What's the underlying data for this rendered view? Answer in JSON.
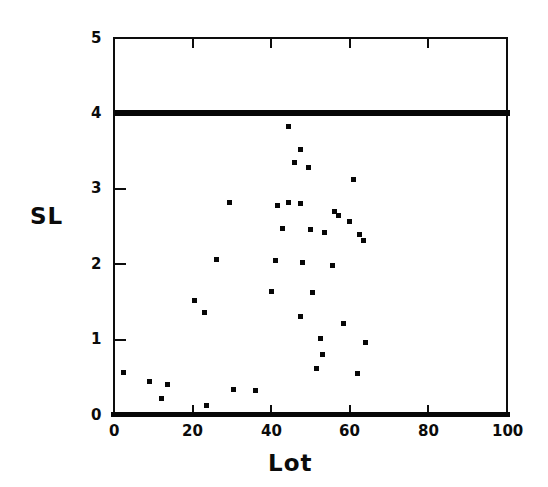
{
  "chart_data": {
    "type": "scatter",
    "title": "",
    "xlabel": "Lot",
    "ylabel": "SL",
    "xlim": [
      0,
      100
    ],
    "ylim": [
      0,
      5
    ],
    "xticks": [
      0,
      20,
      40,
      60,
      80,
      100
    ],
    "yticks": [
      0,
      1,
      2,
      3,
      4,
      5
    ],
    "xtick_labels": [
      "0",
      "20",
      "40",
      "60",
      "80",
      "100"
    ],
    "ytick_labels": [
      "0",
      "1",
      "2",
      "3",
      "4",
      "5"
    ],
    "grid": false,
    "legend": null,
    "marker": "square",
    "marker_color": "#070707",
    "frame_color": "#0d0d0d",
    "series": [
      {
        "name": "SL by Lot",
        "points": [
          [
            1,
            4
          ],
          [
            2,
            4
          ],
          [
            3,
            4
          ],
          [
            4,
            4
          ],
          [
            5,
            4
          ],
          [
            6,
            4
          ],
          [
            7,
            4
          ],
          [
            8,
            4
          ],
          [
            9,
            4
          ],
          [
            10,
            4
          ],
          [
            11,
            4
          ],
          [
            12,
            4
          ],
          [
            13,
            4
          ],
          [
            14,
            4
          ],
          [
            15,
            4
          ],
          [
            16,
            4
          ],
          [
            17,
            4
          ],
          [
            18,
            4
          ],
          [
            19,
            4
          ],
          [
            20,
            4
          ],
          [
            21,
            4
          ],
          [
            22,
            4
          ],
          [
            23,
            4
          ],
          [
            24,
            4
          ],
          [
            25,
            4
          ],
          [
            26,
            4
          ],
          [
            27,
            4
          ],
          [
            28,
            4
          ],
          [
            29,
            4
          ],
          [
            30,
            4
          ],
          [
            31,
            4
          ],
          [
            32,
            4
          ],
          [
            33,
            4
          ],
          [
            34,
            4
          ],
          [
            35,
            4
          ],
          [
            36,
            4
          ],
          [
            37,
            4
          ],
          [
            38,
            4
          ],
          [
            39,
            4
          ],
          [
            40,
            4
          ],
          [
            41,
            4
          ],
          [
            42,
            4
          ],
          [
            43,
            4
          ],
          [
            44,
            4
          ],
          [
            45,
            4
          ],
          [
            46,
            4
          ],
          [
            47,
            4
          ],
          [
            48,
            4
          ],
          [
            49,
            4
          ],
          [
            50,
            4
          ],
          [
            51,
            4
          ],
          [
            52,
            4
          ],
          [
            53,
            4
          ],
          [
            54,
            4
          ],
          [
            55,
            4
          ],
          [
            56,
            4
          ],
          [
            57,
            4
          ],
          [
            58,
            4
          ],
          [
            59,
            4
          ],
          [
            60,
            4
          ],
          [
            61,
            4
          ],
          [
            62,
            4
          ],
          [
            63,
            4
          ],
          [
            64,
            4
          ],
          [
            65,
            4
          ],
          [
            66,
            4
          ],
          [
            67,
            4
          ],
          [
            68,
            4
          ],
          [
            69,
            4
          ],
          [
            70,
            4
          ],
          [
            71,
            4
          ],
          [
            72,
            4
          ],
          [
            73,
            4
          ],
          [
            74,
            4
          ],
          [
            75,
            4
          ],
          [
            76,
            4
          ],
          [
            77,
            4
          ],
          [
            78,
            4
          ],
          [
            79,
            4
          ],
          [
            80,
            4
          ],
          [
            81,
            4
          ],
          [
            82,
            4
          ],
          [
            83,
            4
          ],
          [
            84,
            4
          ],
          [
            85,
            4
          ],
          [
            86,
            4
          ],
          [
            87,
            4
          ],
          [
            88,
            4
          ],
          [
            89,
            4
          ],
          [
            90,
            4
          ],
          [
            91,
            4
          ],
          [
            92,
            4
          ],
          [
            93,
            4
          ],
          [
            94,
            4
          ],
          [
            95,
            4
          ],
          [
            96,
            4
          ],
          [
            97,
            4
          ],
          [
            98,
            4
          ],
          [
            99,
            4
          ],
          [
            100,
            4
          ],
          [
            44.5,
            3.82
          ],
          [
            47.5,
            3.52
          ],
          [
            46.0,
            3.35
          ],
          [
            49.5,
            3.28
          ],
          [
            61.0,
            3.12
          ],
          [
            29.5,
            2.82
          ],
          [
            41.5,
            2.78
          ],
          [
            44.5,
            2.82
          ],
          [
            47.5,
            2.8
          ],
          [
            56.0,
            2.7
          ],
          [
            57.0,
            2.64
          ],
          [
            60.0,
            2.56
          ],
          [
            43.0,
            2.48
          ],
          [
            50.0,
            2.46
          ],
          [
            53.5,
            2.42
          ],
          [
            62.5,
            2.4
          ],
          [
            63.5,
            2.32
          ],
          [
            26.0,
            2.06
          ],
          [
            41.0,
            2.05
          ],
          [
            48.0,
            2.02
          ],
          [
            55.5,
            1.98
          ],
          [
            40.0,
            1.64
          ],
          [
            50.5,
            1.62
          ],
          [
            20.5,
            1.52
          ],
          [
            23.0,
            1.36
          ],
          [
            47.5,
            1.3
          ],
          [
            58.5,
            1.22
          ],
          [
            52.5,
            1.02
          ],
          [
            64.0,
            0.96
          ],
          [
            53.0,
            0.8
          ],
          [
            51.5,
            0.62
          ],
          [
            62.0,
            0.55
          ],
          [
            2.5,
            0.56
          ],
          [
            9.0,
            0.44
          ],
          [
            13.5,
            0.4
          ],
          [
            30.5,
            0.34
          ],
          [
            36.0,
            0.32
          ],
          [
            12.0,
            0.22
          ],
          [
            23.5,
            0.12
          ],
          [
            0,
            0
          ],
          [
            1,
            0
          ],
          [
            2,
            0
          ],
          [
            3,
            0
          ],
          [
            4,
            0
          ],
          [
            5,
            0
          ],
          [
            6,
            0
          ],
          [
            7,
            0
          ],
          [
            8,
            0
          ],
          [
            9,
            0
          ],
          [
            10,
            0
          ],
          [
            11,
            0
          ],
          [
            12,
            0
          ],
          [
            13,
            0
          ],
          [
            14,
            0
          ],
          [
            15,
            0
          ],
          [
            16,
            0
          ],
          [
            17,
            0
          ],
          [
            18,
            0
          ],
          [
            19,
            0
          ],
          [
            20,
            0
          ],
          [
            21,
            0
          ],
          [
            22,
            0
          ],
          [
            23,
            0
          ],
          [
            24,
            0
          ],
          [
            25,
            0
          ],
          [
            26,
            0
          ],
          [
            27,
            0
          ],
          [
            28,
            0
          ],
          [
            29,
            0
          ],
          [
            30,
            0
          ],
          [
            31,
            0
          ],
          [
            32,
            0
          ],
          [
            33,
            0
          ],
          [
            34,
            0
          ],
          [
            35,
            0
          ],
          [
            36,
            0
          ],
          [
            37,
            0
          ],
          [
            38,
            0
          ],
          [
            39,
            0
          ],
          [
            40,
            0
          ],
          [
            41,
            0
          ],
          [
            42,
            0
          ],
          [
            43,
            0
          ],
          [
            44,
            0
          ],
          [
            45,
            0
          ],
          [
            46,
            0
          ],
          [
            47,
            0
          ],
          [
            48,
            0
          ],
          [
            49,
            0
          ],
          [
            50,
            0
          ],
          [
            51,
            0
          ],
          [
            52,
            0
          ],
          [
            53,
            0
          ],
          [
            54,
            0
          ],
          [
            55,
            0
          ],
          [
            56,
            0
          ],
          [
            57,
            0
          ],
          [
            58,
            0
          ],
          [
            59,
            0
          ],
          [
            60,
            0
          ],
          [
            61,
            0
          ],
          [
            62,
            0
          ],
          [
            63,
            0
          ],
          [
            64,
            0
          ],
          [
            65,
            0
          ],
          [
            66,
            0
          ],
          [
            67,
            0
          ],
          [
            68,
            0
          ],
          [
            69,
            0
          ],
          [
            70,
            0
          ],
          [
            71,
            0
          ],
          [
            72,
            0
          ],
          [
            73,
            0
          ],
          [
            74,
            0
          ],
          [
            75,
            0
          ],
          [
            76,
            0
          ],
          [
            77,
            0
          ],
          [
            78,
            0
          ],
          [
            79,
            0
          ],
          [
            80,
            0
          ],
          [
            81,
            0
          ],
          [
            82,
            0
          ],
          [
            83,
            0
          ],
          [
            84,
            0
          ],
          [
            85,
            0
          ],
          [
            86,
            0
          ],
          [
            87,
            0
          ],
          [
            88,
            0
          ],
          [
            89,
            0
          ],
          [
            90,
            0
          ],
          [
            91,
            0
          ],
          [
            92,
            0
          ],
          [
            93,
            0
          ],
          [
            94,
            0
          ],
          [
            95,
            0
          ],
          [
            96,
            0
          ],
          [
            97,
            0
          ],
          [
            98,
            0
          ],
          [
            99,
            0
          ],
          [
            100,
            0
          ]
        ]
      }
    ]
  },
  "geometry": {
    "plot_left": 113,
    "plot_right": 506,
    "plot_top": 37,
    "plot_bottom": 414
  }
}
